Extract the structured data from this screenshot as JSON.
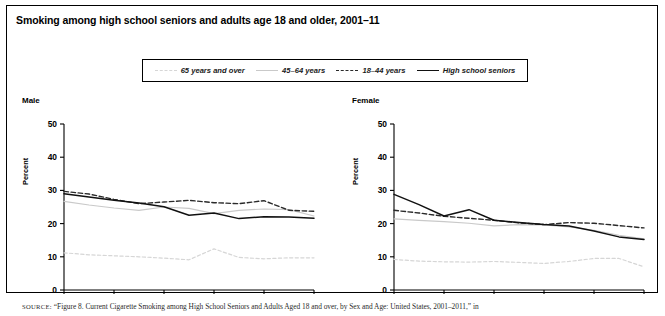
{
  "figure": {
    "title": "Smoking among high school seniors and adults age 18 and older, 2001–11",
    "source_prefix": "SOURCE:",
    "source_text": " “Figure 8. Current Cigarette Smoking among High School Seniors and Adults Aged 18 and over, by Sex and Age: United States, 2001–2011,” in"
  },
  "legend": {
    "items": [
      {
        "label": "65 years and over",
        "style": "dashed",
        "color": "#d6d6d6",
        "swatch": "sw-65"
      },
      {
        "label": "45–64 years",
        "style": "solid",
        "color": "#c9c9c9",
        "swatch": "sw-4564"
      },
      {
        "label": "18–44 years",
        "style": "dashed",
        "color": "#2a2a2a",
        "swatch": "sw-1844"
      },
      {
        "label": "High school seniors",
        "style": "solid",
        "color": "#111111",
        "swatch": "sw-hs"
      }
    ]
  },
  "chart_data": [
    {
      "type": "line",
      "title": "Male",
      "xlabel": "",
      "ylabel": "Percent",
      "x": [
        2001,
        2002,
        2003,
        2004,
        2005,
        2006,
        2007,
        2008,
        2009,
        2010,
        2011
      ],
      "xticks": [
        "2001",
        "2003",
        "2005",
        "2007",
        "2009",
        "2011"
      ],
      "xtick_values": [
        2001,
        2003,
        2005,
        2007,
        2009,
        2011
      ],
      "yticks": [
        0,
        10,
        20,
        30,
        40,
        50
      ],
      "ylim": [
        0,
        50
      ],
      "xlim": [
        2001,
        2011
      ],
      "grid": false,
      "legend_position": "above-shared",
      "series": [
        {
          "name": "High school seniors",
          "style": "solid",
          "color": "#111111",
          "width": 1.5,
          "values": [
            29.0,
            28.0,
            27.0,
            26.2,
            25.1,
            22.5,
            23.2,
            21.5,
            22.1,
            22.0,
            21.6
          ]
        },
        {
          "name": "18–44 years",
          "style": "dashed",
          "color": "#2a2a2a",
          "width": 1.4,
          "values": [
            29.7,
            28.9,
            27.3,
            26.0,
            26.5,
            27.0,
            26.3,
            26.0,
            26.9,
            24.0,
            23.7
          ]
        },
        {
          "name": "45–64 years",
          "style": "solid",
          "color": "#c9c9c9",
          "width": 1.2,
          "values": [
            26.7,
            25.6,
            24.7,
            24.0,
            25.0,
            24.6,
            23.0,
            24.0,
            24.4,
            24.2,
            22.3
          ]
        },
        {
          "name": "65 years and over",
          "style": "dashed",
          "color": "#d6d6d6",
          "width": 1.2,
          "values": [
            11.2,
            10.6,
            10.3,
            10.0,
            9.6,
            9.1,
            12.4,
            9.8,
            9.4,
            9.7,
            9.7,
            8.9
          ]
        }
      ]
    },
    {
      "type": "line",
      "title": "Female",
      "xlabel": "",
      "ylabel": "Percent",
      "x": [
        2001,
        2002,
        2003,
        2004,
        2005,
        2006,
        2007,
        2008,
        2009,
        2010,
        2011
      ],
      "xticks": [
        "2001",
        "2003",
        "2005",
        "2007",
        "2009",
        "2011"
      ],
      "xtick_values": [
        2001,
        2003,
        2005,
        2007,
        2009,
        2011
      ],
      "yticks": [
        0,
        10,
        20,
        30,
        40,
        50
      ],
      "ylim": [
        0,
        50
      ],
      "xlim": [
        2001,
        2011
      ],
      "grid": false,
      "legend_position": "above-shared",
      "series": [
        {
          "name": "High school seniors",
          "style": "solid",
          "color": "#111111",
          "width": 1.5,
          "values": [
            28.8,
            25.7,
            22.3,
            24.2,
            21.0,
            20.3,
            19.7,
            19.3,
            17.8,
            16.0,
            15.2
          ]
        },
        {
          "name": "18–44 years",
          "style": "dashed",
          "color": "#2a2a2a",
          "width": 1.4,
          "values": [
            24.0,
            23.2,
            22.2,
            21.6,
            21.0,
            20.2,
            19.7,
            20.3,
            20.1,
            19.4,
            18.7
          ]
        },
        {
          "name": "45–64 years",
          "style": "solid",
          "color": "#c9c9c9",
          "width": 1.2,
          "values": [
            21.4,
            21.0,
            20.6,
            20.1,
            19.3,
            19.7,
            19.6,
            19.0,
            18.0,
            16.5,
            15.4
          ]
        },
        {
          "name": "65 years and over",
          "style": "dashed",
          "color": "#d6d6d6",
          "width": 1.2,
          "values": [
            9.2,
            8.7,
            8.5,
            8.4,
            8.6,
            8.3,
            8.0,
            8.6,
            9.5,
            9.5,
            7.0
          ]
        }
      ]
    }
  ]
}
